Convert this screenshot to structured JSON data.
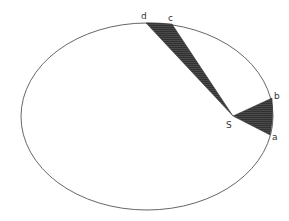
{
  "diagram": {
    "orbit": {
      "cx": 147,
      "cy": 116.5,
      "rx": 126,
      "ry": 93.5,
      "stroke": "#555555"
    },
    "focus": {
      "label": "S",
      "x": 233,
      "y": 116
    },
    "points": {
      "a": {
        "label": "a",
        "x": 270,
        "y": 135
      },
      "b": {
        "label": "b",
        "x": 272,
        "y": 98
      },
      "c": {
        "label": "c",
        "x": 172,
        "y": 24
      },
      "d": {
        "label": "d",
        "x": 146,
        "y": 23
      }
    },
    "sectors": [
      {
        "name": "sector-ab",
        "from": "a",
        "to": "b",
        "fill": "#3a3a3a"
      },
      {
        "name": "sector-cd",
        "from": "c",
        "to": "d",
        "fill": "#3a3a3a"
      }
    ],
    "colors": {
      "background": "#ffffff",
      "shade": "#3a3a3a",
      "line": "#555555"
    }
  }
}
